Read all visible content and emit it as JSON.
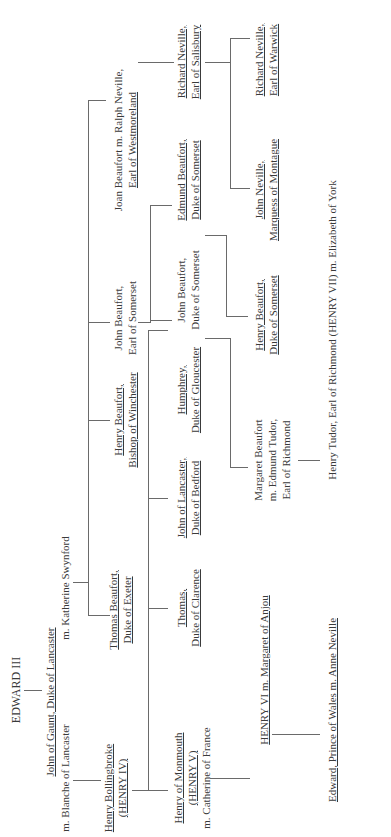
{
  "diagram": {
    "orientation": "rotated-90-ccw",
    "line_color": "#6a6a6a",
    "text_color": "#3a3a3a",
    "nodes": {
      "edward3": {
        "lines": [
          "EDWARD III"
        ]
      },
      "gaunt": {
        "lines": [
          "John of Gaunt, Duke of Lancaster"
        ]
      },
      "blanche": {
        "lines": [
          "m. Blanche of Lancaster"
        ]
      },
      "katherine": {
        "lines": [
          "m. Katherine Swynford"
        ]
      },
      "henry4": {
        "lines": [
          "Henry Bollingbroke",
          "(HENRY IV)"
        ]
      },
      "thomas_exeter": {
        "lines": [
          "Thomas Beaufort,",
          "Duke of Exeter"
        ]
      },
      "henry_winchester": {
        "lines": [
          "Henry Beaufort,",
          "Bishop of Winchester"
        ]
      },
      "john_somerset_earl": {
        "lines": [
          "John Beaufort,",
          "Earl of Somerset"
        ]
      },
      "joan": {
        "lines": [
          "Joan Beaufort m. Ralph Neville,",
          "Earl of Westmoreland"
        ]
      },
      "henry5": {
        "lines": [
          "Henry of Monmouth",
          "(HENRY V)",
          "m. Catherine of France"
        ]
      },
      "thomas_clarence": {
        "lines": [
          "Thomas,",
          "Duke of Clarence"
        ]
      },
      "john_bedford": {
        "lines": [
          "John of Lancaster,",
          "Duke of Bedford"
        ]
      },
      "humphrey": {
        "lines": [
          "Humphrey,",
          "Duke of Gloucester"
        ]
      },
      "john_somerset_duke": {
        "lines": [
          "John Beaufort,",
          "Duke of Somerset"
        ]
      },
      "edmund_somerset": {
        "lines": [
          "Edmund Beaufort,",
          "Duke of Somerset"
        ]
      },
      "richard_salisbury": {
        "lines": [
          "Richard Neville,",
          "Earl of Salisbury"
        ]
      },
      "henry6": {
        "lines": [
          "HENRY VI m. Margaret of Anjou"
        ]
      },
      "margaret_beaufort": {
        "lines": [
          "Margaret Beaufort",
          "m. Edmund Tudor,",
          "Earl of Richmond"
        ]
      },
      "henry_somerset": {
        "lines": [
          "Henry Beaufort,",
          "Duke of Somerset"
        ]
      },
      "john_montague": {
        "lines": [
          "John Neville,",
          "Marquess of Montague"
        ]
      },
      "richard_warwick": {
        "lines": [
          "Richard Neville,",
          "Earl of Warwick"
        ]
      },
      "edward_wales": {
        "lines": [
          "Edward, Prince of Wales m. Anne Neville"
        ]
      },
      "henry7": {
        "lines": [
          "Henry Tudor, Earl of Richmond (HENRY VII) m. Elizabeth of York"
        ]
      }
    }
  }
}
